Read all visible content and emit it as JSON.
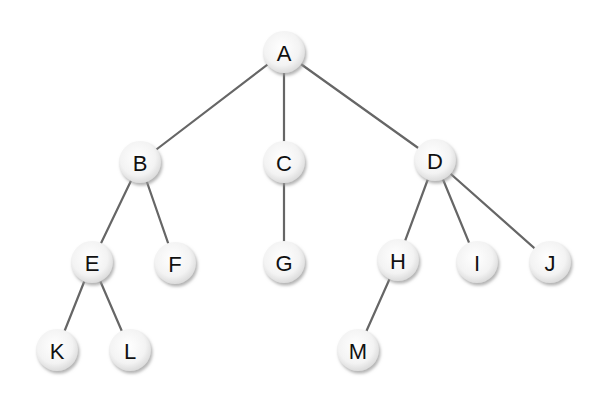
{
  "diagram": {
    "type": "tree",
    "colors": {
      "edge": "#666666",
      "node_fill_center": "#ffffff",
      "node_fill_edge": "#e2e2e2",
      "node_shadow": "#b5b5b5",
      "label": "#111111"
    },
    "node_radius": 21,
    "nodes": [
      {
        "id": "A",
        "label": "A",
        "x": 284,
        "y": 52
      },
      {
        "id": "B",
        "label": "B",
        "x": 140,
        "y": 162
      },
      {
        "id": "C",
        "label": "C",
        "x": 284,
        "y": 162
      },
      {
        "id": "D",
        "label": "D",
        "x": 435,
        "y": 160
      },
      {
        "id": "E",
        "label": "E",
        "x": 92,
        "y": 262
      },
      {
        "id": "F",
        "label": "F",
        "x": 175,
        "y": 263
      },
      {
        "id": "G",
        "label": "G",
        "x": 284,
        "y": 262
      },
      {
        "id": "H",
        "label": "H",
        "x": 398,
        "y": 260
      },
      {
        "id": "I",
        "label": "I",
        "x": 477,
        "y": 262
      },
      {
        "id": "J",
        "label": "J",
        "x": 550,
        "y": 262
      },
      {
        "id": "K",
        "label": "K",
        "x": 57,
        "y": 350
      },
      {
        "id": "L",
        "label": "L",
        "x": 130,
        "y": 350
      },
      {
        "id": "M",
        "label": "M",
        "x": 358,
        "y": 350
      }
    ],
    "edges": [
      {
        "from": "A",
        "to": "B"
      },
      {
        "from": "A",
        "to": "C"
      },
      {
        "from": "A",
        "to": "D"
      },
      {
        "from": "B",
        "to": "E"
      },
      {
        "from": "B",
        "to": "F"
      },
      {
        "from": "C",
        "to": "G"
      },
      {
        "from": "D",
        "to": "H"
      },
      {
        "from": "D",
        "to": "I"
      },
      {
        "from": "D",
        "to": "J"
      },
      {
        "from": "E",
        "to": "K"
      },
      {
        "from": "E",
        "to": "L"
      },
      {
        "from": "H",
        "to": "M"
      }
    ]
  }
}
